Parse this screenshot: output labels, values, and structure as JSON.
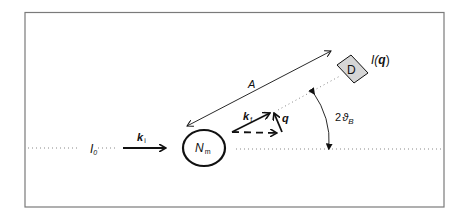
{
  "diagram": {
    "labels": {
      "incident_intensity": "I",
      "incident_intensity_sub": "0",
      "incident_wavevector": "k",
      "incident_wavevector_sub": "i",
      "sample": "N",
      "sample_sub": "m",
      "final_wavevector": "k",
      "final_wavevector_sub": "f",
      "scattering_vector": "q",
      "distance": "A",
      "detector": "D",
      "scattered_intensity": "I(q)",
      "scattered_intensity_main": "I(",
      "scattered_intensity_arg": "q",
      "scattered_intensity_close": ")",
      "angle_prefix": "2",
      "angle_symbol": "ϑ",
      "angle_sub": "B"
    },
    "colors": {
      "frame": "#7a7a7a",
      "ink": "#111111",
      "detector_fill": "#d6d6d6",
      "dotted": "#888888"
    }
  }
}
